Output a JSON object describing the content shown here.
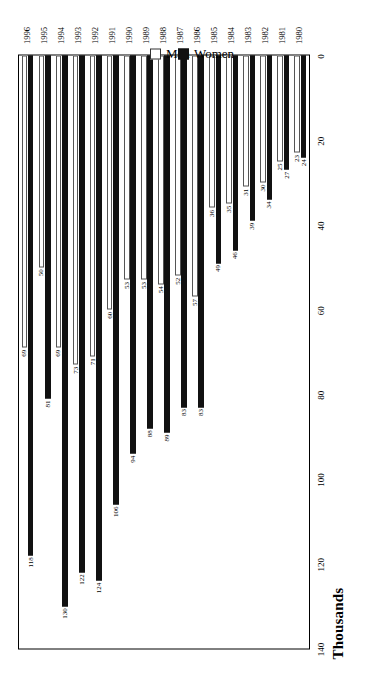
{
  "chart_data": {
    "type": "bar",
    "orientation": "horizontal",
    "title": "",
    "xlabel": "Thousands",
    "ylabel": "",
    "xlim": [
      0,
      140
    ],
    "xticks": [
      140,
      120,
      100,
      80,
      60,
      40,
      20,
      0
    ],
    "grid": false,
    "legend_position": "bottom",
    "categories": [
      "1996",
      "1995",
      "1994",
      "1993",
      "1992",
      "1991",
      "1990",
      "1989",
      "1988",
      "1987",
      "1986",
      "1985",
      "1984",
      "1983",
      "1982",
      "1981",
      "1980"
    ],
    "series": [
      {
        "name": "Women",
        "color": "#111111",
        "values": [
          118,
          81,
          130,
          122,
          124,
          106,
          94,
          88,
          89,
          83,
          83,
          49,
          46,
          39,
          34,
          27,
          24
        ]
      },
      {
        "name": "Men",
        "color": "#ffffff",
        "values": [
          69,
          50,
          69,
          73,
          71,
          60,
          53,
          53,
          54,
          52,
          57,
          36,
          35,
          31,
          30,
          25,
          23
        ]
      }
    ]
  },
  "legend": {
    "items": [
      {
        "label": "Men"
      },
      {
        "label": "Women"
      }
    ]
  }
}
